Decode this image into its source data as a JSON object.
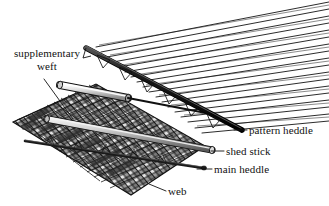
{
  "figure": {
    "kind": "line-diagram",
    "background_color": "#ffffff",
    "ink_color": "#111111",
    "width": 329,
    "height": 206
  },
  "labels": {
    "supplementary_weft": "supplementary\nweft",
    "supplementary_weft_line1": "supplementary",
    "supplementary_weft_line2": "weft",
    "pattern_heddle": "pattern heddle",
    "shed_stick": "shed stick",
    "main_heddle": "main heddle",
    "web": "web"
  },
  "parts": [
    {
      "name": "web",
      "description": "woven cloth shown as a cross-hatched parallelogram of warp and weft threads in perspective",
      "fill": "#d8d8d8",
      "stroke": "#111111"
    },
    {
      "name": "supplementary-weft",
      "description": "shaded cylindrical rod carrying the supplementary weft yarn",
      "fill": "#bcbcbc",
      "stroke": "#111111"
    },
    {
      "name": "pattern-heddle",
      "description": "thick dark bar with triangular heddle loops suspended beneath it",
      "fill": "#1a1a1a",
      "stroke": "#000000"
    },
    {
      "name": "shed-stick",
      "description": "light grey cylinder inserted through the warp to hold the shed open",
      "fill": "#c9c9c9",
      "stroke": "#111111"
    },
    {
      "name": "main-heddle",
      "description": "thin dark rod carrying the main heddle loops",
      "fill": "#2a2a2a",
      "stroke": "#000000"
    },
    {
      "name": "warp-threads",
      "description": "fan of fine warp threads running to the upper right",
      "stroke": "#111111"
    }
  ],
  "leader_lines": [
    {
      "name": "supplementary-weft-leader",
      "from": [
        44,
        79
      ],
      "to": [
        73,
        119
      ]
    },
    {
      "name": "pattern-heddle-leader",
      "from": [
        247,
        130
      ],
      "to": [
        235,
        130
      ]
    },
    {
      "name": "shed-stick-leader",
      "from": [
        224,
        151
      ],
      "to": [
        212,
        151
      ]
    },
    {
      "name": "main-heddle-leader",
      "from": [
        212,
        169
      ],
      "to": [
        198,
        169
      ]
    },
    {
      "name": "web-leader",
      "from": [
        166,
        191
      ],
      "to": [
        150,
        184
      ]
    }
  ]
}
